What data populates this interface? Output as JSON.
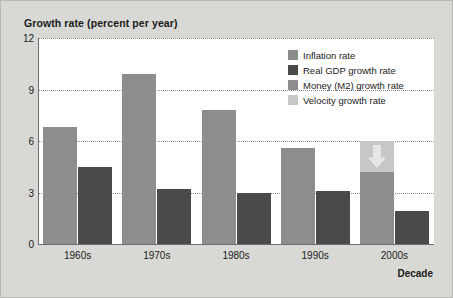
{
  "chart_data": {
    "type": "bar",
    "title": "Growth rate (percent per year)",
    "xlabel": "Decade",
    "ylabel": "Growth rate (percent per year)",
    "categories": [
      "1960s",
      "1970s",
      "1980s",
      "1990s",
      "2000s"
    ],
    "ylim": [
      0,
      12
    ],
    "yticks": [
      "0",
      "3",
      "6",
      "9",
      "12"
    ],
    "ytick_values": [
      0,
      3,
      6,
      9,
      12
    ],
    "grid": true,
    "legend_position": "top-right",
    "series": [
      {
        "name": "Inflation rate",
        "color": "#8d8d8d",
        "values": [
          6.8,
          9.9,
          7.8,
          5.6,
          4.2
        ]
      },
      {
        "name": "Real GDP growth rate",
        "color": "#4a4a4a",
        "values": [
          4.5,
          3.2,
          3.0,
          3.1,
          1.9
        ]
      },
      {
        "name": "Money (M2) growth rate",
        "color": "#8d8d8d",
        "values": [
          null,
          null,
          null,
          null,
          null
        ]
      },
      {
        "name": "Velocity growth rate",
        "color": "#c7c7c7",
        "values": [
          null,
          null,
          null,
          1.6,
          1.8
        ]
      }
    ],
    "annotations": [
      {
        "category": "1990s",
        "kind": "velocity-increase",
        "arrow": "up",
        "from": 0,
        "to": 1.6,
        "color": "#c7c7c7"
      },
      {
        "category": "2000s",
        "kind": "velocity-decrease",
        "arrow": "down",
        "from": 6.0,
        "to": 4.2,
        "color": "#c7c7c7"
      }
    ]
  },
  "legend": {
    "items": [
      {
        "label": "Inflation rate",
        "color": "#8d8d8d"
      },
      {
        "label": "Real GDP growth rate",
        "color": "#4a4a4a"
      },
      {
        "label": "Money (M2) growth rate",
        "color": "#8d8d8d"
      },
      {
        "label": "Velocity growth rate",
        "color": "#c7c7c7"
      }
    ]
  },
  "axes": {
    "y_title": "Growth rate (percent per year)",
    "x_title": "Decade"
  }
}
